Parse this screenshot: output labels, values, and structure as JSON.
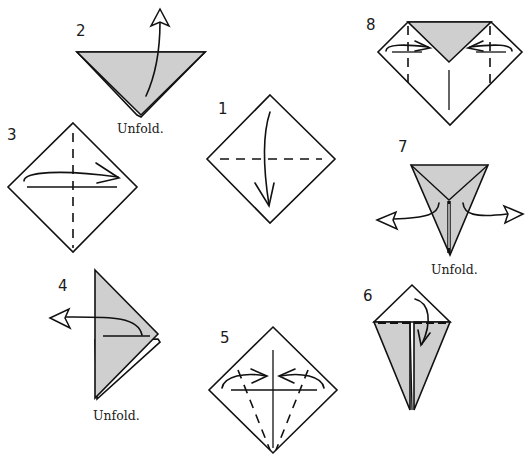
{
  "diagram": {
    "type": "origami-instructions",
    "colors": {
      "paper_front": "#ffffff",
      "paper_back": "#cfcfcf",
      "line": "#111111"
    },
    "steps": [
      {
        "number": "1",
        "caption": "",
        "action": "valley fold top corner down to bottom corner"
      },
      {
        "number": "2",
        "caption": "Unfold.",
        "action": "unfold"
      },
      {
        "number": "3",
        "caption": "",
        "action": "valley fold left corner to right corner"
      },
      {
        "number": "4",
        "caption": "Unfold.",
        "action": "unfold"
      },
      {
        "number": "5",
        "caption": "",
        "action": "fold lower edges to center crease"
      },
      {
        "number": "6",
        "caption": "",
        "action": "fold top corner down"
      },
      {
        "number": "7",
        "caption": "Unfold.",
        "action": "unfold both sides"
      },
      {
        "number": "8",
        "caption": "",
        "action": "fold side corners inward along creases"
      }
    ]
  }
}
